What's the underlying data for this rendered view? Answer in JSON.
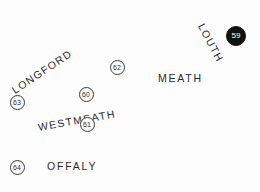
{
  "map": {
    "background_color": "#fdfdfd",
    "label_color": "#2a2a2a",
    "badge_outline_color": "#3a3a3a",
    "badge_fill_color": "#111111",
    "badge_fill_text_color": "#ffffff",
    "regions": [
      {
        "name": "LONGFORD",
        "x": 13,
        "y": 86,
        "rotation": -34,
        "font_size": 10.5,
        "letter_spacing": 1.3
      },
      {
        "name": "LOUTH",
        "x": 201,
        "y": 19,
        "rotation": 62,
        "font_size": 10.5,
        "letter_spacing": 1.3
      },
      {
        "name": "MEATH",
        "x": 158,
        "y": 73,
        "rotation": 0,
        "font_size": 10.5,
        "letter_spacing": 1.8
      },
      {
        "name": "WESTMEATH",
        "x": 38,
        "y": 122,
        "rotation": -10,
        "font_size": 10.5,
        "letter_spacing": 1.4
      },
      {
        "name": "OFFALY",
        "x": 47,
        "y": 161,
        "rotation": 0,
        "font_size": 10.5,
        "letter_spacing": 1.8
      }
    ],
    "badges": [
      {
        "label": "59",
        "cx": 236,
        "cy": 36,
        "diameter": 20,
        "style": "filled",
        "font_size": 8
      },
      {
        "label": "62",
        "cx": 117,
        "cy": 67,
        "diameter": 15,
        "style": "outline",
        "font_size": 7
      },
      {
        "label": "60",
        "cx": 86,
        "cy": 94,
        "diameter": 15,
        "style": "outline",
        "font_size": 7
      },
      {
        "label": "63",
        "cx": 17,
        "cy": 102,
        "diameter": 15,
        "style": "outline",
        "font_size": 7
      },
      {
        "label": "61",
        "cx": 87,
        "cy": 124,
        "diameter": 15,
        "style": "outline",
        "font_size": 7
      },
      {
        "label": "64",
        "cx": 17,
        "cy": 167,
        "diameter": 15,
        "style": "outline",
        "font_size": 7
      }
    ]
  }
}
